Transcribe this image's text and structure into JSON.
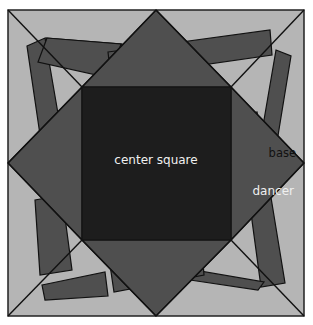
{
  "colors": {
    "base": "#b5b5b5",
    "dancer": "#4f4f4f",
    "center": "#1d1d1d",
    "stroke": "#111111",
    "label_light": "#f0f0f0",
    "label_dark": "#111111"
  },
  "labels": {
    "center": "center square",
    "base": "base",
    "dancer": "dancer"
  },
  "geometry": {
    "outer": {
      "x1": 8,
      "y1": 10,
      "x2": 304,
      "y2": 316
    },
    "center": {
      "x1": 82,
      "y1": 87,
      "x2": 231,
      "y2": 240
    }
  }
}
